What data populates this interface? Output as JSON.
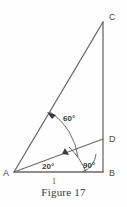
{
  "figure": {
    "caption": "Figure 17",
    "caption_x": 63,
    "caption_y": 186,
    "background_color": "#fefefe",
    "line_color": "#6a6a6a",
    "arc_color": "#5a5a5a",
    "text_color": "#4a4a4a",
    "vertices": [
      {
        "name": "A",
        "label": "A",
        "x": 14,
        "y": 172,
        "label_x": 3,
        "label_y": 175
      },
      {
        "name": "B",
        "label": "B",
        "x": 103,
        "y": 172,
        "label_x": 109,
        "label_y": 176
      },
      {
        "name": "C",
        "label": "C",
        "x": 103,
        "y": 22,
        "label_x": 109,
        "label_y": 19
      },
      {
        "name": "D",
        "label": "D",
        "x": 103,
        "y": 139,
        "label_x": 109,
        "label_y": 142
      }
    ],
    "segments": [
      {
        "name": "base-AB",
        "from": "A",
        "to": "B",
        "x1": 14,
        "y1": 172,
        "x2": 103,
        "y2": 172
      },
      {
        "name": "hypotenuse-AC",
        "from": "A",
        "to": "C",
        "x1": 14,
        "y1": 172,
        "x2": 103,
        "y2": 22
      },
      {
        "name": "vertical-CB",
        "from": "C",
        "to": "B",
        "x1": 103,
        "y1": 22,
        "x2": 103,
        "y2": 172
      },
      {
        "name": "interior-AD",
        "from": "A",
        "to": "D",
        "x1": 14,
        "y1": 172,
        "x2": 103,
        "y2": 139
      }
    ],
    "angles": [
      {
        "name": "angle-DAC",
        "label": "60°",
        "value": 60,
        "unit": "degrees",
        "at_vertex": "A",
        "between": [
          "D",
          "C"
        ],
        "label_x": 63,
        "label_y": 121,
        "arc_path": "M 78 157 A 64 64 0 0 0 50 112",
        "arrow_tip_x": 48,
        "arrow_tip_y": 113
      },
      {
        "name": "angle-BAD",
        "label": "20°",
        "value": 20,
        "unit": "degrees",
        "at_vertex": "A",
        "between": [
          "B",
          "D"
        ],
        "label_x": 50,
        "label_y": 169,
        "arc_path": "M 86 172 A 72 72 0 0 0 69 147",
        "arrow_tip_x": 66,
        "arrow_tip_y": 150
      },
      {
        "name": "angle-ABC",
        "label": "90°",
        "value": 90,
        "unit": "degrees",
        "at_vertex": "B",
        "between": [
          "A",
          "C"
        ],
        "label_x": 90,
        "label_y": 168,
        "arc_path": "M 82 172 A 21 21 0 0 0 96 154",
        "arrow_tip_x": null,
        "arrow_tip_y": null
      }
    ],
    "side_labels": [
      {
        "name": "side-AB-length",
        "label": "1",
        "of_segment": "base-AB",
        "x": 54,
        "y": 183
      }
    ]
  }
}
